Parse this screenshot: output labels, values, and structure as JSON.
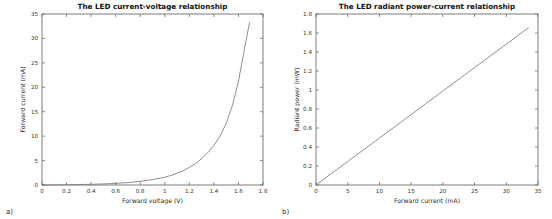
{
  "figure": {
    "background": "#ffffff",
    "line_color": "#7a7a7a",
    "axis_color": "#6e6e6e"
  },
  "panels": [
    {
      "caption": "a)"
    },
    {
      "caption": "b)"
    }
  ],
  "chart_data": [
    {
      "type": "line",
      "title": "The LED current-voltage relationship",
      "xlabel": "Forward voltage (V)",
      "ylabel": "Forward current (mA)",
      "xlim": [
        0,
        1.8
      ],
      "ylim": [
        0,
        35
      ],
      "xticks": [
        0,
        0.2,
        0.4,
        0.6,
        0.8,
        1,
        1.2,
        1.4,
        1.6,
        1.8
      ],
      "xticklabels": [
        "0",
        "0.2",
        "0.4",
        "0.6",
        "0.8",
        "1",
        "1.2",
        "1.4",
        "1.6",
        "1.8"
      ],
      "yticks": [
        0,
        5,
        10,
        15,
        20,
        25,
        30,
        35
      ],
      "yticklabels": [
        "0",
        "5",
        "10",
        "15",
        "20",
        "25",
        "30",
        "35"
      ],
      "grid": false,
      "legend": null,
      "series": [
        {
          "name": "I-V curve",
          "x": [
            0,
            0.1,
            0.2,
            0.3,
            0.4,
            0.5,
            0.6,
            0.7,
            0.8,
            0.9,
            1.0,
            1.05,
            1.1,
            1.15,
            1.2,
            1.25,
            1.3,
            1.35,
            1.4,
            1.45,
            1.5,
            1.55,
            1.6,
            1.65,
            1.69
          ],
          "y": [
            0,
            0.02,
            0.05,
            0.09,
            0.14,
            0.22,
            0.33,
            0.5,
            0.75,
            1.1,
            1.6,
            1.95,
            2.4,
            2.95,
            3.6,
            4.4,
            5.4,
            6.6,
            8.1,
            10.0,
            12.6,
            16.2,
            21.2,
            28.0,
            33.2
          ]
        }
      ]
    },
    {
      "type": "line",
      "title": "The LED radiant power-current relationship",
      "xlabel": "Forward current (mA)",
      "ylabel": "Radiant power (mW)",
      "xlim": [
        0,
        35
      ],
      "ylim": [
        0,
        1.8
      ],
      "xticks": [
        0,
        5,
        10,
        15,
        20,
        25,
        30,
        35
      ],
      "xticklabels": [
        "0",
        "5",
        "10",
        "15",
        "20",
        "25",
        "30",
        "35"
      ],
      "yticks": [
        0,
        0.2,
        0.4,
        0.6,
        0.8,
        1.0,
        1.2,
        1.4,
        1.6,
        1.8
      ],
      "yticklabels": [
        "0",
        "0.2",
        "0.4",
        "0.6",
        "0.8",
        "1",
        "1.2",
        "1.4",
        "1.6",
        "1.8"
      ],
      "grid": false,
      "legend": null,
      "series": [
        {
          "name": "P-I curve",
          "x": [
            0,
            5,
            10,
            15,
            20,
            25,
            30,
            33.5
          ],
          "y": [
            0,
            0.247,
            0.494,
            0.742,
            0.989,
            1.236,
            1.483,
            1.656
          ]
        }
      ]
    }
  ]
}
